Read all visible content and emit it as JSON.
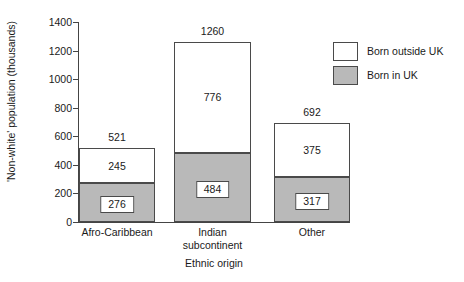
{
  "chart_data": {
    "type": "bar",
    "subtype": "stacked-bar",
    "title": "",
    "xlabel": "Ethnic origin",
    "ylabel": "'Non-white' population (thousands)",
    "ylim": [
      0,
      1400
    ],
    "yticks": [
      0,
      200,
      400,
      600,
      800,
      1000,
      1200,
      1400
    ],
    "ytick_labels": [
      "0",
      "200",
      "400",
      "600",
      "800",
      "1000",
      "1200",
      "1400"
    ],
    "grid": false,
    "legend_position": "top-right",
    "categories": [
      "Afro-Caribbean",
      "Indian subcontinent",
      "Other"
    ],
    "series": [
      {
        "name": "Born in UK",
        "color": "#b9b9b9",
        "values": [
          276,
          484,
          317
        ]
      },
      {
        "name": "Born outside UK",
        "color": "#ffffff",
        "values": [
          245,
          776,
          375
        ]
      }
    ],
    "totals": [
      521,
      1260,
      692
    ],
    "bars": [
      {
        "category": "Afro-Caribbean",
        "category_lines": "Afro-Caribbean",
        "total": 521,
        "total_label": "521",
        "in_uk": 276,
        "in_uk_label": "276",
        "outside_uk": 245,
        "outside_uk_label": "245"
      },
      {
        "category": "Indian subcontinent",
        "category_lines": "Indian\nsubcontinent",
        "total": 1260,
        "total_label": "1260",
        "in_uk": 484,
        "in_uk_label": "484",
        "outside_uk": 776,
        "outside_uk_label": "776"
      },
      {
        "category": "Other",
        "category_lines": "Other",
        "total": 692,
        "total_label": "692",
        "in_uk": 317,
        "in_uk_label": "317",
        "outside_uk": 375,
        "outside_uk_label": "375"
      }
    ]
  },
  "legend": {
    "items": [
      {
        "label": "Born outside UK",
        "swatch": "white"
      },
      {
        "label": "Born in UK",
        "swatch": "gray"
      }
    ]
  },
  "colors": {
    "born_in_uk": "#b9b9b9",
    "born_outside_uk": "#ffffff",
    "outline": "#4a4a4a",
    "background": "#ffffff",
    "text": "#1a1a1a"
  }
}
